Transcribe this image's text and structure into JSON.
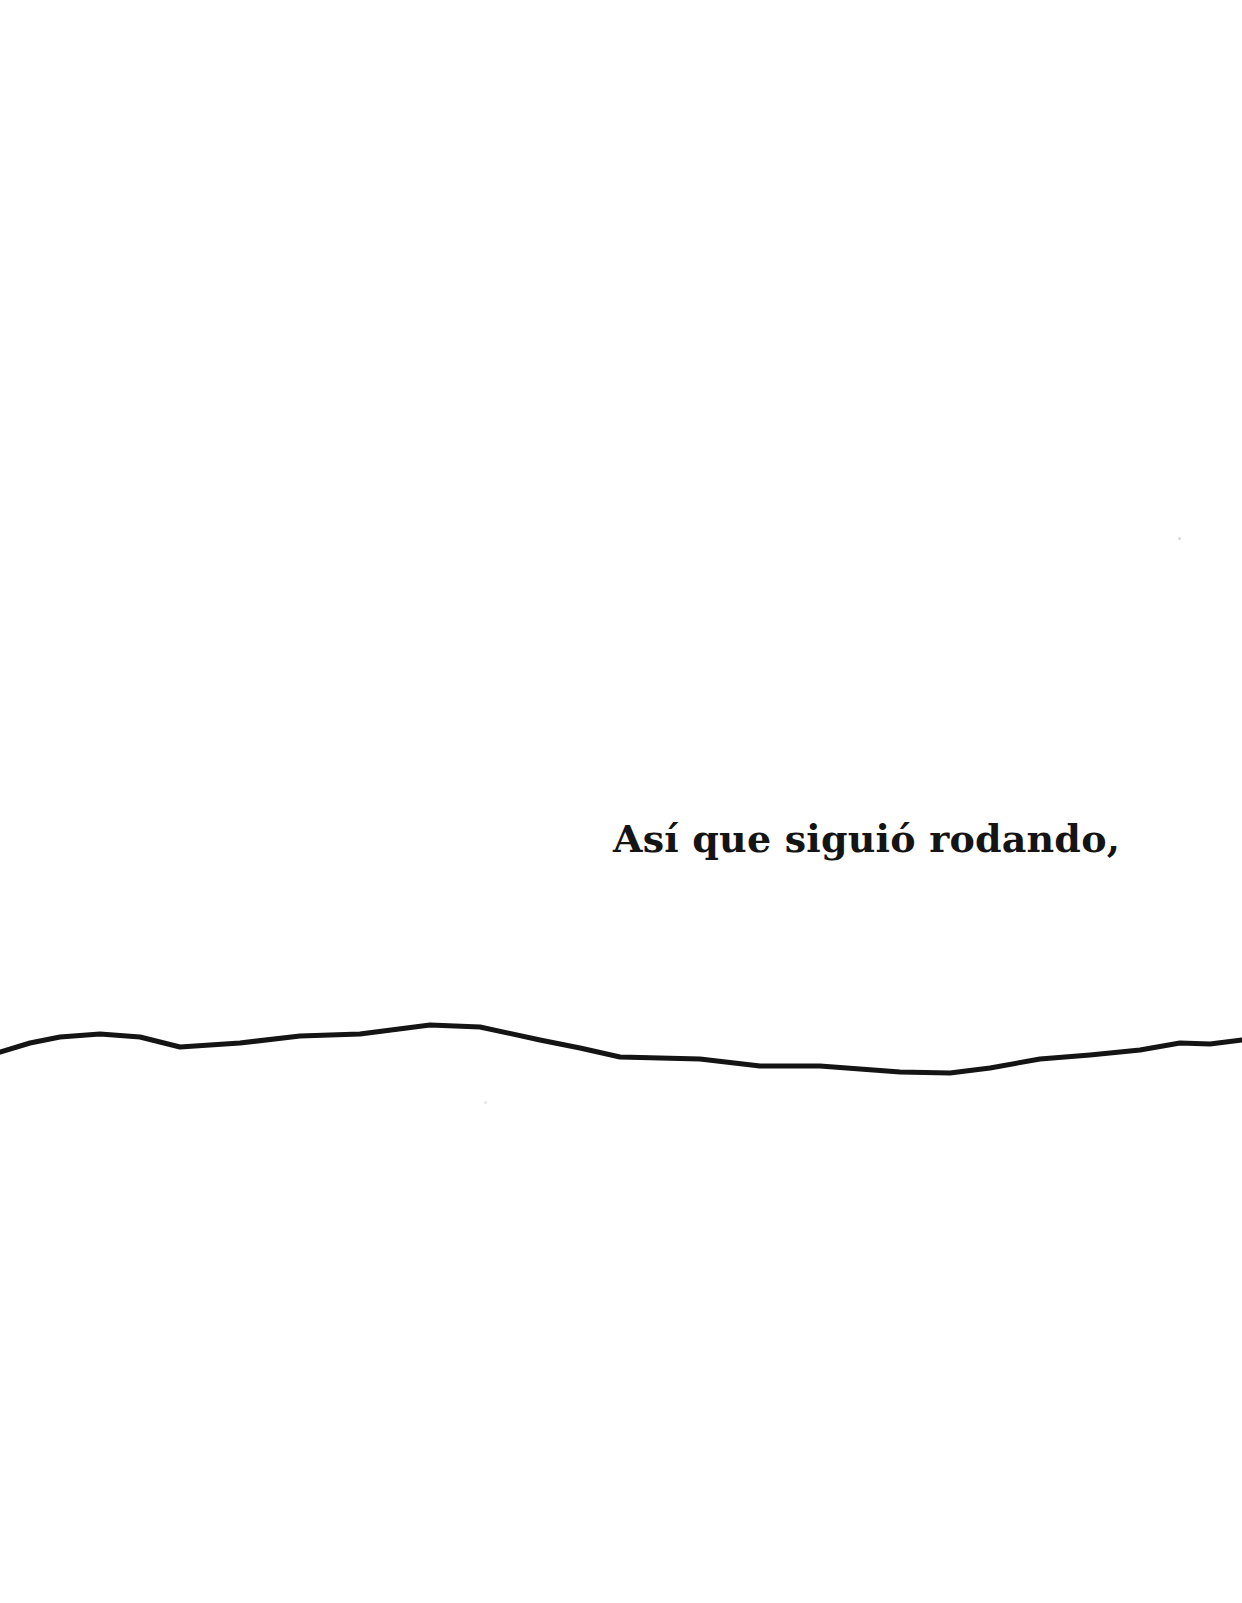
{
  "page": {
    "background": "#ffffff",
    "text": {
      "line": "Así que siguió rodando,",
      "color": "#141414"
    },
    "drawing": {
      "description": "hand-drawn wavy horizontal line",
      "stroke": "#141414",
      "stroke_width": 5,
      "points": "0,1052 30,1043 60,1037 100,1034 140,1037 180,1047 240,1043 300,1036 360,1034 430,1025 480,1027 540,1040 580,1048 620,1057 700,1059 760,1066 820,1066 900,1072 950,1073 990,1068 1040,1059 1090,1055 1140,1050 1180,1043 1210,1044 1242,1040"
    }
  }
}
